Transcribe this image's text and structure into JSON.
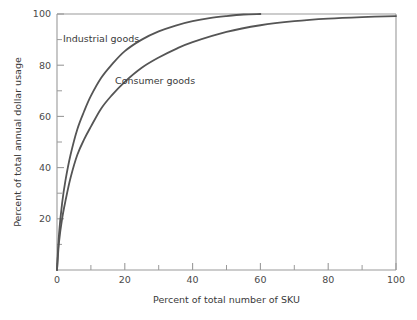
{
  "chart_data": {
    "type": "line",
    "title": "",
    "xlabel": "Percent of total number of SKU",
    "ylabel": "Percent of total annual dollar usage",
    "xlim": [
      0,
      100
    ],
    "ylim": [
      0,
      100
    ],
    "grid": false,
    "legend_position": "inline-annotation",
    "x_ticks": [
      0,
      20,
      40,
      60,
      80,
      100
    ],
    "x_tick_labels": [
      "0",
      "20",
      "40",
      "60",
      "80",
      "100"
    ],
    "x_minor_ticks": [
      10,
      30,
      50,
      70,
      90
    ],
    "y_ticks": [
      20,
      40,
      60,
      80,
      100
    ],
    "y_tick_labels": [
      "20",
      "40",
      "60",
      "80",
      "100"
    ],
    "y_minor_ticks": [
      10,
      30,
      50,
      70,
      90
    ],
    "series": [
      {
        "name": "Industrial goods",
        "color": "#555555",
        "x": [
          0,
          0.6,
          1.5,
          2.5,
          4,
          6,
          8,
          10,
          13,
          16,
          20,
          25,
          30,
          35,
          40,
          45,
          50,
          55,
          60
        ],
        "values": [
          0,
          14,
          26,
          35,
          45,
          55,
          62,
          68,
          75,
          80,
          85.5,
          90,
          93.2,
          95.5,
          97.2,
          98.4,
          99.2,
          99.8,
          100
        ]
      },
      {
        "name": "Consumer goods",
        "color": "#555555",
        "x": [
          0,
          0.6,
          1.5,
          2.5,
          4,
          6,
          8,
          10,
          13,
          16,
          20,
          25,
          30,
          35,
          40,
          50,
          60,
          70,
          80,
          90,
          100
        ],
        "values": [
          0,
          11,
          20,
          27,
          36,
          45,
          51,
          56,
          63,
          68,
          73.5,
          79,
          83,
          86.3,
          89,
          93,
          95.6,
          97.2,
          98.2,
          98.8,
          99.2
        ]
      }
    ],
    "annotations": [
      {
        "text": "Industrial goods",
        "x_px": 63,
        "y_px": 42
      },
      {
        "text": "Consumer goods",
        "x_px": 115,
        "y_px": 84
      }
    ],
    "colors": {
      "curve": "#555555",
      "axis": "#9a9a9a",
      "text": "#3a3a3a"
    }
  }
}
